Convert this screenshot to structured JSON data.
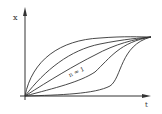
{
  "figure": {
    "y_axis_label": "x",
    "x_axis_label": "t",
    "curve_label": "n = 1",
    "curve_count": 5
  },
  "colors": {
    "ink": "#333333",
    "background": "#ffffff"
  }
}
